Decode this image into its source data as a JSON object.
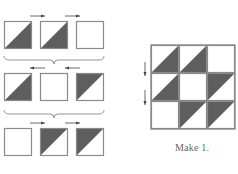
{
  "figure": {
    "type": "quilt-block-assembly",
    "colors": {
      "dark": "#5e5e5e",
      "light": "#ffffff",
      "border": "#8a8a8a",
      "arrow": "#444444"
    },
    "assembly_rows": [
      {
        "row": 1,
        "cells": [
          "dark-lower-right",
          "dark-lower-right",
          "plain"
        ],
        "press_direction": "right",
        "arrows": [
          "right",
          "right"
        ]
      },
      {
        "row": 2,
        "cells": [
          "dark-lower-right",
          "plain",
          "dark-upper-left"
        ],
        "press_direction": "left",
        "arrows": [
          "left",
          "left"
        ]
      },
      {
        "row": 3,
        "cells": [
          "plain",
          "dark-upper-left",
          "dark-upper-left"
        ],
        "press_direction": "right",
        "arrows": [
          "right",
          "right"
        ]
      }
    ],
    "finished_block": {
      "grid": [
        [
          "dark-lower-right",
          "dark-lower-right",
          "plain"
        ],
        [
          "dark-lower-right",
          "plain",
          "dark-upper-left"
        ],
        [
          "plain",
          "dark-upper-left",
          "dark-upper-left"
        ]
      ],
      "seam_press_arrows": [
        "down",
        "down"
      ]
    },
    "caption": "Make 1."
  }
}
